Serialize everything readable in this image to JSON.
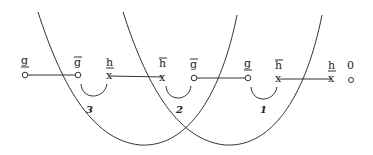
{
  "diagram": {
    "nodes": [
      {
        "id": "n1",
        "label": "g",
        "mark": "under",
        "shape": "circle",
        "x": 25,
        "y": 75
      },
      {
        "id": "n2",
        "label": "g",
        "mark": "over",
        "shape": "circle",
        "x": 78,
        "y": 75
      },
      {
        "id": "n3",
        "label": "h",
        "mark": "under",
        "shape": "cross",
        "x": 110,
        "y": 75
      },
      {
        "id": "n4",
        "label": "h",
        "mark": "over",
        "shape": "cross",
        "x": 163,
        "y": 75
      },
      {
        "id": "n5",
        "label": "g",
        "mark": "over",
        "shape": "circle",
        "x": 194,
        "y": 77
      },
      {
        "id": "n6",
        "label": "g",
        "mark": "under",
        "shape": "circle",
        "x": 248,
        "y": 77
      },
      {
        "id": "n7",
        "label": "h",
        "mark": "over",
        "shape": "cross",
        "x": 279,
        "y": 78
      },
      {
        "id": "n8",
        "label": "h",
        "mark": "under",
        "shape": "cross",
        "x": 332,
        "y": 78
      },
      {
        "id": "n9",
        "label": "0",
        "mark": "none",
        "shape": "circle",
        "x": 350,
        "y": 78
      }
    ],
    "edges": [
      {
        "from": "n1",
        "to": "n2"
      },
      {
        "from": "n3",
        "to": "n4"
      },
      {
        "from": "n5",
        "to": "n6"
      },
      {
        "from": "n7",
        "to": "n8"
      }
    ],
    "small_arcs": [
      {
        "label": "3",
        "x1": 81,
        "x2": 107,
        "label_x": 88,
        "label_y": 113
      },
      {
        "label": "2",
        "x1": 166,
        "x2": 191,
        "label_x": 177,
        "label_y": 113
      },
      {
        "label": "1",
        "x1": 251,
        "x2": 277,
        "label_x": 261,
        "label_y": 113
      }
    ],
    "big_curves": [
      {
        "id": "curve-left"
      },
      {
        "id": "curve-right"
      }
    ],
    "labels": {
      "n1": "g",
      "n2": "g",
      "n3": "h",
      "n4": "h",
      "n5": "g",
      "n6": "g",
      "n7": "h",
      "n8": "h",
      "n9": "0",
      "arc3": "3",
      "arc2": "2",
      "arc1": "1"
    }
  }
}
